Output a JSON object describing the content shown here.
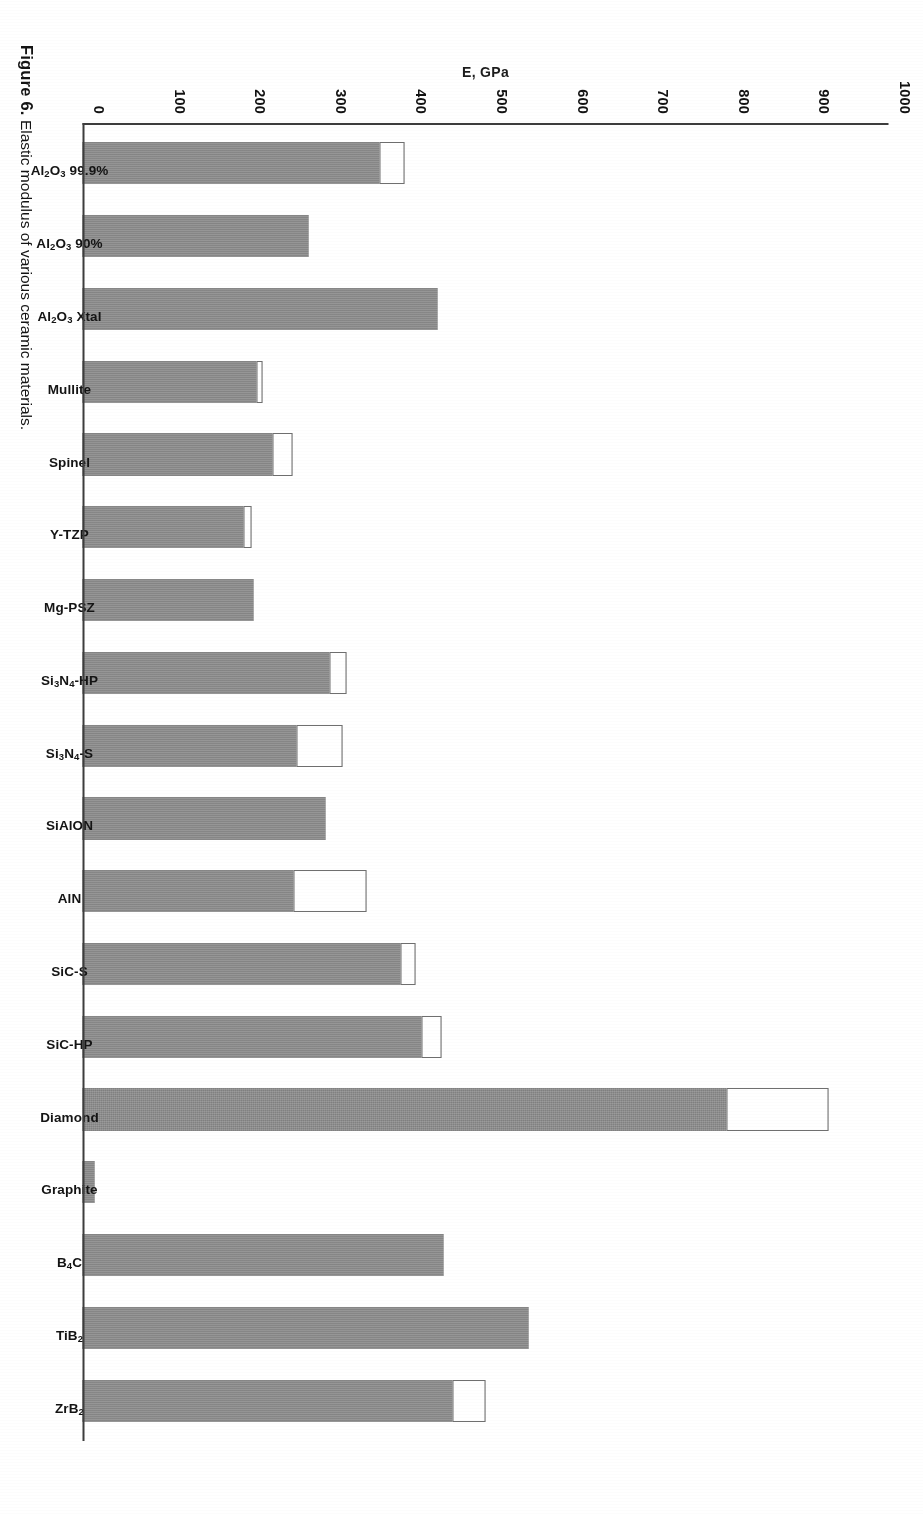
{
  "figure": {
    "number_label": "Figure 6.",
    "caption_text": "Elastic modulus of various ceramic materials."
  },
  "axes": {
    "y_title": "E, GPa",
    "x_title": "Material",
    "y_ticks": [
      "0",
      "100",
      "200",
      "300",
      "400",
      "500",
      "600",
      "700",
      "800",
      "900",
      "1000"
    ]
  },
  "style": {
    "bar_fill": "#8a8a8a",
    "bar_cap_fill": "#ffffff",
    "bar_cap_stroke": "#6f6f6f",
    "axis_color": "#3d3d3d",
    "text_color": "#141414",
    "background": "#ffffff"
  },
  "chart_data": {
    "type": "bar",
    "title": "",
    "xlabel": "Material",
    "ylabel": "E, GPa",
    "ylim": [
      0,
      1000
    ],
    "ytick_step": 100,
    "grid": false,
    "legend": "none",
    "orientation": "vertical",
    "note": "Each bar shows a typical (shaded) elastic modulus value; bars with an open/white cap extend to an upper range value.",
    "categories": [
      "Al2O3 99.9%",
      "Al2O3 90%",
      "Al2O3 Xtal",
      "Mullite",
      "Spinel",
      "Y-TZP",
      "Mg-PSZ",
      "Si3N4-HP",
      "Si3N4-S",
      "SiAlON",
      "AlN",
      "SiC-S",
      "SiC-HP",
      "Diamond",
      "Graphite",
      "B4C",
      "TiB2",
      "ZrB2"
    ],
    "series": [
      {
        "name": "Typical E (shaded portion)",
        "values": [
          368,
          280,
          441,
          216,
          236,
          200,
          212,
          307,
          265,
          302,
          262,
          394,
          421,
          799,
          13,
          448,
          553,
          459
        ]
      },
      {
        "name": "Upper range E (open cap top)",
        "values": [
          399,
          280,
          441,
          223,
          260,
          210,
          212,
          328,
          323,
          302,
          352,
          413,
          446,
          925,
          15,
          448,
          553,
          500
        ]
      }
    ]
  }
}
